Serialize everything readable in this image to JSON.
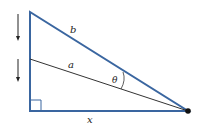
{
  "diagram": {
    "type": "right-triangle-geometry",
    "labels": {
      "hypotenuse": "b",
      "inner_segment": "a",
      "angle": "θ",
      "base": "x"
    },
    "colors": {
      "triangle_stroke": "#3a66a0",
      "inner_line": "#333333",
      "arrow": "#222222",
      "vertex_dot": "#111111"
    },
    "arrows": [
      {
        "direction": "down",
        "meaning": "top vertex moving down"
      },
      {
        "direction": "down",
        "meaning": "inner point moving down"
      }
    ]
  }
}
